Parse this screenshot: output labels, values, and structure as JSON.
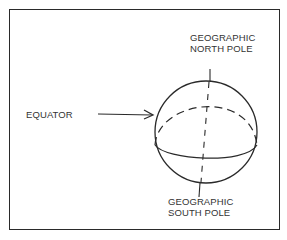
{
  "diagram": {
    "type": "globe",
    "labels": {
      "north_line1": "GEOGRAPHIC",
      "north_line2": "NORTH POLE",
      "equator": "EQUATOR",
      "south_line1": "GEOGRAPHIC",
      "south_line2": "SOUTH POLE"
    },
    "colors": {
      "stroke": "#2a2a2a",
      "text": "#333333",
      "background": "#ffffff"
    }
  }
}
